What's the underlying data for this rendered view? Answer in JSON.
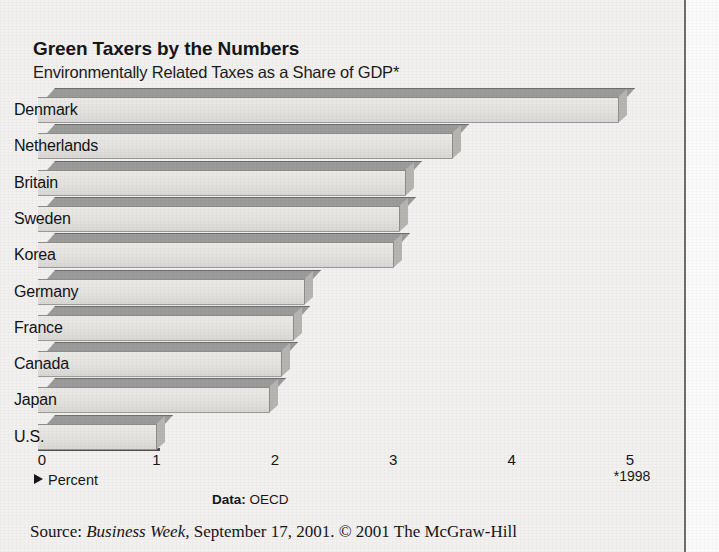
{
  "header": {
    "title": "Green Taxers by the Numbers",
    "subtitle": "Environmentally Related Taxes as a Share of GDP*"
  },
  "axis": {
    "unit_label": "Percent",
    "footnote": "*1998",
    "tick_labels": [
      "0",
      "1",
      "2",
      "3",
      "4",
      "5"
    ]
  },
  "credits": {
    "data_prefix": "Data:",
    "data_source": "OECD",
    "source_prefix": "Source:",
    "publication": "Business Week,",
    "source_rest": "September 17, 2001. © 2001 The McGraw-Hill"
  },
  "chart_data": {
    "type": "bar",
    "orientation": "horizontal",
    "title": "Green Taxers by the Numbers",
    "subtitle": "Environmentally Related Taxes as a Share of GDP*",
    "xlabel": "Percent",
    "ylabel": "",
    "xlim": [
      0,
      5
    ],
    "xticks": [
      0,
      1,
      2,
      3,
      4,
      5
    ],
    "grid": false,
    "legend": null,
    "note": "*1998",
    "source": "OECD",
    "categories": [
      "Denmark",
      "Netherlands",
      "Britain",
      "Sweden",
      "Korea",
      "Germany",
      "France",
      "Canada",
      "Japan",
      "U.S."
    ],
    "values": [
      4.9,
      3.5,
      3.1,
      3.05,
      3.0,
      2.25,
      2.15,
      2.05,
      1.95,
      1.0
    ]
  },
  "colors": {
    "page_background": "#f2f1ef",
    "bar_front": "#e6e4e1",
    "bar_top": "#9b9b99",
    "bar_cap": "#b6b5b2",
    "text": "#16171b",
    "rule": "#6e6e6e"
  }
}
